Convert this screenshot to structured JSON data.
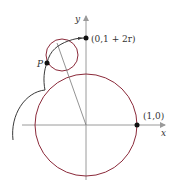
{
  "diagram": {
    "axis_labels": {
      "x": "x",
      "y": "y"
    },
    "points": {
      "P": "P",
      "top": "(0,1 + 2r)",
      "right": "(1,0)"
    },
    "colors": {
      "circle": "#8b2a3a",
      "curve": "#3a3a3a",
      "axis": "#9a9a9a",
      "point": "#111111"
    },
    "elements": [
      "large unit circle centered at origin",
      "small rolling circle of radius r",
      "epicycloid-like traced curve",
      "radius line from origin through small circle"
    ]
  }
}
